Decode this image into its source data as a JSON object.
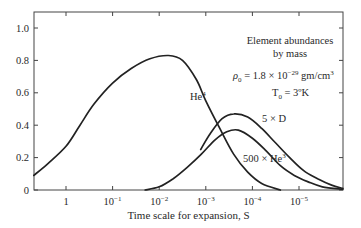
{
  "chart_data": {
    "type": "line",
    "title": "Element abundances by mass",
    "xlabel": "Time scale for expansion, S",
    "ylabel": "",
    "xscale": "log (reversed)",
    "xlim_log10": [
      0.69,
      -5.94
    ],
    "ylim": [
      0,
      1.1
    ],
    "grid": false,
    "x_ticks": [
      {
        "log": 0,
        "label": "1"
      },
      {
        "log": -1,
        "label": "10",
        "exp": "−1"
      },
      {
        "log": -2,
        "label": "10",
        "exp": "−2"
      },
      {
        "log": -3,
        "label": "10",
        "exp": "−3"
      },
      {
        "log": -4,
        "label": "10",
        "exp": "−4"
      },
      {
        "log": -5,
        "label": "10",
        "exp": "−5"
      }
    ],
    "y_ticks": [
      {
        "value": 0,
        "label": "0"
      },
      {
        "value": 0.2,
        "label": "0.2"
      },
      {
        "value": 0.4,
        "label": "0.4"
      },
      {
        "value": 0.6,
        "label": "0.6"
      },
      {
        "value": 0.8,
        "label": "0.8"
      },
      {
        "value": 1.0,
        "label": "1.0"
      }
    ],
    "annotations": {
      "line1": "Element abundances",
      "line2": "by mass",
      "rho_prefix": "ρ",
      "rho_sub": "0",
      "rho_value": " = 1.8 × 10",
      "rho_exp": "−29",
      "rho_unit": " gm/cm",
      "rho_unit_exp": "3",
      "temp_prefix": "T",
      "temp_sub": "0",
      "temp_value": " = 3ºK"
    },
    "series": [
      {
        "name": "He4",
        "label": "He",
        "label_sup": "4",
        "log10_S": [
          0.69,
          0.4,
          0.0,
          -0.3,
          -0.6,
          -1.0,
          -1.4,
          -1.8,
          -2.2,
          -2.5,
          -2.8,
          -3.0,
          -3.3,
          -3.6,
          -3.9,
          -4.2,
          -4.6
        ],
        "values": [
          0.09,
          0.16,
          0.27,
          0.4,
          0.53,
          0.66,
          0.75,
          0.81,
          0.83,
          0.8,
          0.68,
          0.55,
          0.38,
          0.22,
          0.11,
          0.04,
          0.0
        ]
      },
      {
        "name": "5 × D",
        "label": "5 × D",
        "log10_S": [
          -2.89,
          -3.1,
          -3.35,
          -3.6,
          -3.9,
          -4.2,
          -4.5,
          -4.8,
          -5.1,
          -5.4,
          -5.7,
          -5.94
        ],
        "values": [
          0.25,
          0.35,
          0.44,
          0.47,
          0.45,
          0.38,
          0.29,
          0.2,
          0.12,
          0.07,
          0.03,
          0.01
        ]
      },
      {
        "name": "500 × He3",
        "label": "500 × He",
        "label_sup": "3",
        "log10_S": [
          -1.7,
          -2.0,
          -2.3,
          -2.6,
          -2.9,
          -3.2,
          -3.45,
          -3.7,
          -4.0,
          -4.3,
          -4.6,
          -4.9,
          -5.2,
          -5.5,
          -5.94
        ],
        "values": [
          0.0,
          0.02,
          0.07,
          0.14,
          0.22,
          0.31,
          0.36,
          0.37,
          0.32,
          0.24,
          0.15,
          0.09,
          0.05,
          0.02,
          0.005
        ]
      }
    ]
  },
  "layout": {
    "plot_left": 34,
    "plot_right": 343,
    "plot_top": 12,
    "plot_bottom": 190,
    "x_origin_px": 66,
    "px_per_decade": 46.6,
    "px_per_unit_y": 162
  }
}
